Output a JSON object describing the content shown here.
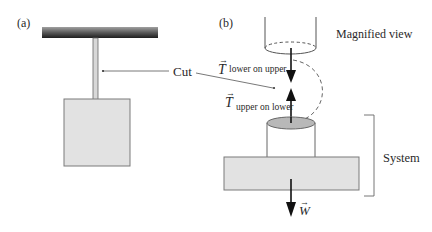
{
  "panels": {
    "a": {
      "label": "(a)"
    },
    "b": {
      "label": "(b)"
    }
  },
  "labels": {
    "cut": "Cut",
    "magnified_view": "Magnified view",
    "system": "System"
  },
  "forces": {
    "tension_lower_on_upper": {
      "symbol": "T",
      "vector_mark": "→",
      "subscript": "lower on upper",
      "direction": "down"
    },
    "tension_upper_on_lower": {
      "symbol": "T",
      "vector_mark": "→",
      "subscript": "upper on lower",
      "direction": "up"
    },
    "weight": {
      "symbol": "W",
      "vector_mark": "→",
      "direction": "down"
    }
  },
  "colors": {
    "block_fill": "#e2e2e2",
    "block_stroke": "#7a7a7a",
    "ceiling_dark": "#2b2b2b",
    "ceiling_light": "#9a9a9a",
    "cut_face_fill": "#b8b8b8",
    "arrow": "#111111",
    "line": "#555555"
  }
}
